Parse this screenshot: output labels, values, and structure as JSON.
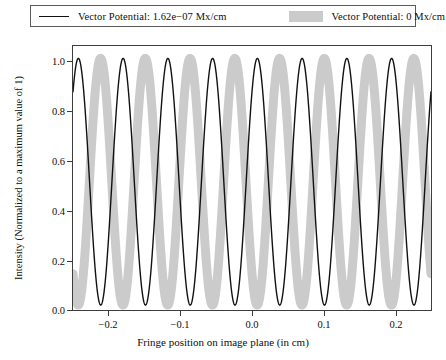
{
  "chart_data": {
    "type": "line",
    "title": "",
    "xlabel": "Fringe position on image plane (in cm)",
    "ylabel": "Intensity (Normalized to a maximum value of 1)",
    "xlim": [
      -0.25,
      0.25
    ],
    "ylim": [
      -0.02,
      1.05
    ],
    "xticks": [
      -0.2,
      -0.1,
      0.0,
      0.1,
      0.2
    ],
    "xticklabels": [
      "−0.2",
      "−0.1",
      "0.0",
      "0.1",
      "0.2"
    ],
    "yticks": [
      0.0,
      0.2,
      0.4,
      0.6,
      0.8,
      1.0
    ],
    "yticklabels": [
      "0.0",
      "0.2",
      "0.4",
      "0.6",
      "0.8",
      "1.0"
    ],
    "grid": false,
    "legend_position": "above-axes",
    "series": [
      {
        "name": "Vector Potential: 1.62e−07 Mx/cm",
        "style": "line",
        "color": "#111111",
        "linewidth": 1.4,
        "form": "cos_squared",
        "period_cm": 0.0625,
        "phase_cm": -0.2425,
        "amplitude": 1.0,
        "baseline": 0.0,
        "description": "Interference fringe intensity shifted by the magnetic vector potential (Aharonov-Bohm phase shift).",
        "peaks_x": [
          -0.2425,
          -0.18,
          -0.1175,
          -0.055,
          0.0075,
          0.07,
          0.1325,
          0.195,
          0.2475
        ],
        "troughs_x": [
          -0.21125,
          -0.14875,
          -0.08625,
          -0.02375,
          0.03875,
          0.10125,
          0.16375,
          0.22625
        ]
      },
      {
        "name": "Vector Potential: 0 Mx/cm",
        "style": "band",
        "color": "#cbcbcb",
        "linewidth": 9,
        "form": "cos_squared",
        "period_cm": 0.0625,
        "phase_cm": -0.2115,
        "amplitude": 1.0,
        "baseline": 0.0,
        "description": "Unshifted reference interference fringe intensity with zero vector potential.",
        "peaks_x": [
          -0.2115,
          -0.149,
          -0.0865,
          -0.024,
          0.0385,
          0.101,
          0.1635,
          0.226
        ],
        "troughs_x": [
          -0.2425,
          -0.18025,
          -0.11775,
          -0.05525,
          0.00725,
          0.06975,
          0.13225,
          0.19475,
          0.2475
        ]
      }
    ]
  },
  "legend": {
    "entries": [
      {
        "label": "Vector Potential: 1.62e−07 Mx/cm",
        "swatch": "line-swatch",
        "color": "#111111"
      },
      {
        "label": "Vector Potential: 0 Mx/cm",
        "swatch": "band-swatch",
        "color": "#cbcbcb"
      }
    ]
  },
  "axes": {
    "x_title": "Fringe position on image plane (in cm)",
    "y_title": "Intensity (Normalized to a maximum value of 1)",
    "x_ticklabels": [
      "−0.2",
      "−0.1",
      "0.0",
      "0.1",
      "0.2"
    ],
    "y_ticklabels": [
      "0.0",
      "0.2",
      "0.4",
      "0.6",
      "0.8",
      "1.0"
    ]
  },
  "colors": {
    "line": "#111111",
    "band": "#cbcbcb",
    "frame": "#3d3d3d",
    "background": "#ffffff",
    "text": "#0d0d0d"
  }
}
